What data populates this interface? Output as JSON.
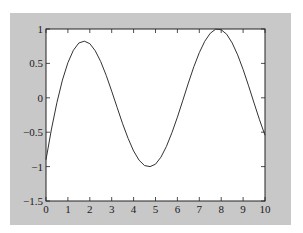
{
  "figure": {
    "background": "#c8c8c8",
    "axes_background": "#ffffff",
    "line_color": "#333333"
  },
  "chart_data": {
    "type": "line",
    "title": "",
    "xlabel": "",
    "ylabel": "",
    "xlim": [
      0,
      10
    ],
    "ylim": [
      -1.5,
      1
    ],
    "grid": false,
    "legend": null,
    "xticks": [
      0,
      1,
      2,
      3,
      4,
      5,
      6,
      7,
      8,
      9,
      10
    ],
    "xtick_labels": [
      "0",
      "1",
      "2",
      "3",
      "4",
      "5",
      "6",
      "7",
      "8",
      "9",
      "10"
    ],
    "yticks": [
      -1.5,
      -1,
      -0.5,
      0,
      0.5,
      1
    ],
    "ytick_labels": [
      "-1.5",
      "-1",
      "-0.5",
      "0",
      "0.5",
      "1"
    ],
    "series": [
      {
        "name": "y",
        "x": [
          0,
          0.25,
          0.5,
          0.75,
          1,
          1.25,
          1.5,
          1.75,
          2,
          2.25,
          2.5,
          2.75,
          3,
          3.25,
          3.5,
          3.75,
          4,
          4.25,
          4.5,
          4.75,
          5,
          5.25,
          5.5,
          5.75,
          6,
          6.25,
          6.5,
          6.75,
          7,
          7.25,
          7.5,
          7.75,
          8,
          8.25,
          8.5,
          8.75,
          9,
          9.25,
          9.5,
          9.75,
          10
        ],
        "y": [
          -0.9,
          -0.454,
          -0.067,
          0.257,
          0.51,
          0.691,
          0.797,
          0.823,
          0.787,
          0.683,
          0.525,
          0.325,
          0.096,
          -0.142,
          -0.378,
          -0.591,
          -0.773,
          -0.907,
          -0.985,
          -1.0,
          -0.965,
          -0.862,
          -0.706,
          -0.507,
          -0.282,
          -0.035,
          0.214,
          0.451,
          0.656,
          0.822,
          0.938,
          0.998,
          0.989,
          0.924,
          0.798,
          0.624,
          0.412,
          0.174,
          -0.075,
          -0.32,
          -0.544
        ]
      }
    ]
  }
}
